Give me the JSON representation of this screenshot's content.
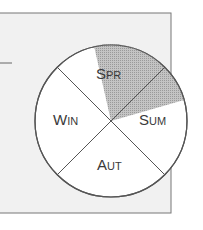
{
  "diagram": {
    "type": "season-wheel",
    "colors": {
      "panel_fill": "#f1f1f1",
      "panel_stroke": "#777777",
      "circle_fill": "#ffffff",
      "circle_stroke": "#555555",
      "highlight_fill": "#b4b4b4",
      "text": "#3a3a3a"
    },
    "quadrants": [
      {
        "id": "spr",
        "big": "S",
        "small": "PR",
        "highlighted": true
      },
      {
        "id": "sum",
        "big": "S",
        "small": "UM",
        "highlighted": false
      },
      {
        "id": "aut",
        "big": "A",
        "small": "UT",
        "highlighted": false
      },
      {
        "id": "win",
        "big": "W",
        "small": "IN",
        "highlighted": false
      }
    ]
  }
}
